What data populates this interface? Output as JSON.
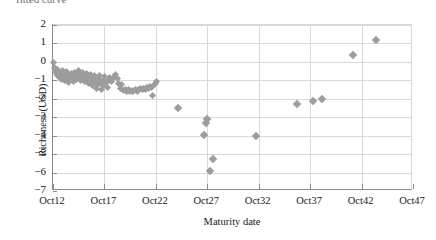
{
  "caption_fragment": "fitted curve",
  "axis_title_color": "#1a1a1a",
  "marker_color": "#9d9d9d",
  "gridline_color": "#d9d9d9",
  "axis_color": "#8a8a8a",
  "chart_data": {
    "type": "scatter",
    "title": "",
    "xlabel": "Maturity date",
    "ylabel": "Richeness (USD)",
    "xtick_labels": [
      "Oct12",
      "Oct17",
      "Oct22",
      "Oct27",
      "Oct32",
      "Oct37",
      "Oct42",
      "Oct47"
    ],
    "xtick_values": [
      12,
      17,
      22,
      27,
      32,
      37,
      42,
      47
    ],
    "ytick_labels": [
      "2",
      "1",
      "0",
      "-1",
      "-2",
      "-3",
      "-4",
      "-5",
      "-6",
      "-7"
    ],
    "ytick_values": [
      2,
      1,
      0,
      -1,
      -2,
      -3,
      -4,
      -5,
      -6,
      -7
    ],
    "xlim": [
      12,
      47
    ],
    "ylim": [
      -7,
      2
    ],
    "grid": true,
    "legend": false,
    "marker": "diamond",
    "series": [
      {
        "name": "Richeness",
        "points": [
          [
            12.05,
            -0.05
          ],
          [
            12.15,
            -0.3
          ],
          [
            12.25,
            -0.5
          ],
          [
            12.3,
            -0.62
          ],
          [
            12.4,
            -0.72
          ],
          [
            12.45,
            -0.4
          ],
          [
            12.55,
            -0.55
          ],
          [
            12.6,
            -0.85
          ],
          [
            12.7,
            -0.68
          ],
          [
            12.8,
            -0.95
          ],
          [
            12.9,
            -0.45
          ],
          [
            12.95,
            -0.78
          ],
          [
            13.05,
            -0.6
          ],
          [
            13.15,
            -1.02
          ],
          [
            13.25,
            -0.88
          ],
          [
            13.3,
            -0.52
          ],
          [
            13.45,
            -0.7
          ],
          [
            13.55,
            -1.1
          ],
          [
            13.6,
            -0.92
          ],
          [
            13.75,
            -0.62
          ],
          [
            13.85,
            -0.8
          ],
          [
            13.95,
            -1.05
          ],
          [
            14.05,
            -0.58
          ],
          [
            14.15,
            -0.75
          ],
          [
            14.25,
            -0.95
          ],
          [
            14.35,
            -0.68
          ],
          [
            14.45,
            -0.48
          ],
          [
            14.55,
            -0.82
          ],
          [
            14.65,
            -1.0
          ],
          [
            14.75,
            -0.72
          ],
          [
            14.85,
            -0.55
          ],
          [
            14.95,
            -0.9
          ],
          [
            15.05,
            -1.08
          ],
          [
            15.15,
            -0.78
          ],
          [
            15.25,
            -0.62
          ],
          [
            15.35,
            -0.95
          ],
          [
            15.45,
            -1.18
          ],
          [
            15.55,
            -0.85
          ],
          [
            15.65,
            -0.7
          ],
          [
            15.75,
            -1.02
          ],
          [
            15.85,
            -1.3
          ],
          [
            15.95,
            -0.92
          ],
          [
            16.05,
            -0.75
          ],
          [
            16.15,
            -1.1
          ],
          [
            16.25,
            -1.45
          ],
          [
            16.35,
            -1.22
          ],
          [
            16.45,
            -0.88
          ],
          [
            16.55,
            -0.72
          ],
          [
            16.65,
            -1.05
          ],
          [
            16.75,
            -1.52
          ],
          [
            16.85,
            -1.28
          ],
          [
            16.95,
            -0.95
          ],
          [
            17.05,
            -0.8
          ],
          [
            17.15,
            -1.12
          ],
          [
            17.25,
            -1.38
          ],
          [
            17.35,
            -1.02
          ],
          [
            17.5,
            -0.85
          ],
          [
            17.65,
            -1.08
          ],
          [
            17.8,
            -0.92
          ],
          [
            17.95,
            -0.78
          ],
          [
            18.1,
            -0.7
          ],
          [
            18.25,
            -0.88
          ],
          [
            18.4,
            -1.15
          ],
          [
            18.55,
            -1.42
          ],
          [
            18.7,
            -1.25
          ],
          [
            18.85,
            -1.55
          ],
          [
            19.0,
            -1.48
          ],
          [
            19.15,
            -1.58
          ],
          [
            19.3,
            -1.52
          ],
          [
            19.45,
            -1.6
          ],
          [
            19.6,
            -1.55
          ],
          [
            19.75,
            -1.62
          ],
          [
            19.9,
            -1.56
          ],
          [
            20.05,
            -1.5
          ],
          [
            20.2,
            -1.58
          ],
          [
            20.35,
            -1.52
          ],
          [
            20.5,
            -1.45
          ],
          [
            20.65,
            -1.5
          ],
          [
            20.8,
            -1.42
          ],
          [
            20.95,
            -1.48
          ],
          [
            21.1,
            -1.38
          ],
          [
            21.25,
            -1.42
          ],
          [
            21.4,
            -1.32
          ],
          [
            21.55,
            -1.36
          ],
          [
            21.7,
            -1.8
          ],
          [
            21.85,
            -1.25
          ],
          [
            22.0,
            -1.15
          ],
          [
            22.1,
            -1.08
          ],
          [
            24.1,
            -2.5
          ],
          [
            26.7,
            -3.95
          ],
          [
            26.85,
            -3.3
          ],
          [
            27.0,
            -3.12
          ],
          [
            27.55,
            -5.25
          ],
          [
            27.25,
            -5.9
          ],
          [
            31.7,
            -4.0
          ],
          [
            35.7,
            -2.3
          ],
          [
            37.3,
            -2.1
          ],
          [
            38.1,
            -2.02
          ],
          [
            41.2,
            0.38
          ],
          [
            43.4,
            1.2
          ]
        ]
      }
    ]
  }
}
